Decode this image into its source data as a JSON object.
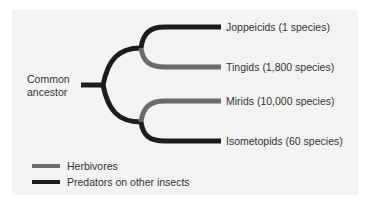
{
  "colors": {
    "background": "#f3f3f3",
    "herbivore": "#6b6b6b",
    "predator": "#1c1c1c",
    "text": "#333333"
  },
  "tree": {
    "root_label_line1": "Common",
    "root_label_line2": "ancestor",
    "taxa": [
      {
        "name": "Joppeicids (1 species)",
        "diet": "predator"
      },
      {
        "name": "Tingids (1,800 species)",
        "diet": "herbivore"
      },
      {
        "name": "Mirids (10,000 species)",
        "diet": "herbivore"
      },
      {
        "name": "Isometopids (60 species)",
        "diet": "predator"
      }
    ]
  },
  "legend": {
    "items": [
      {
        "label": "Herbivores",
        "swatch": "herbivore"
      },
      {
        "label": "Predators on other insects",
        "swatch": "predator"
      }
    ]
  }
}
